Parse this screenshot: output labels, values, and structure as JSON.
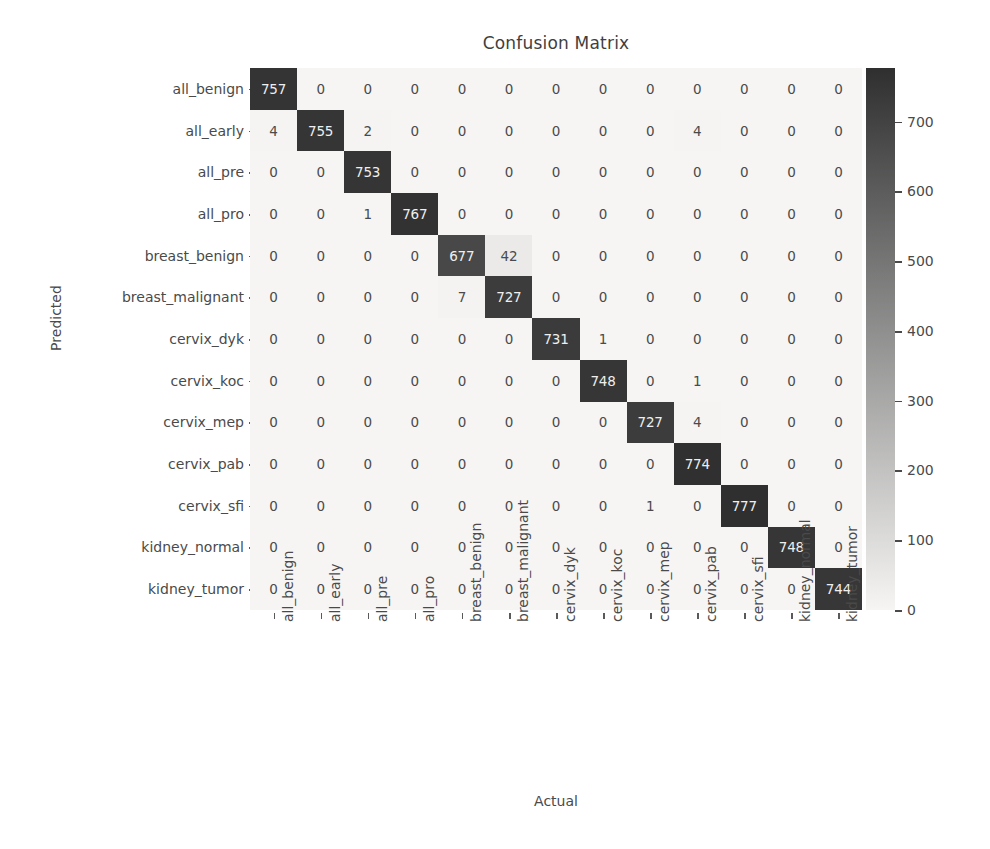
{
  "chart_data": {
    "type": "heatmap",
    "title": "Confusion Matrix",
    "xlabel": "Actual",
    "ylabel": "Predicted",
    "categories": [
      "all_benign",
      "all_early",
      "all_pre",
      "all_pro",
      "breast_benign",
      "breast_malignant",
      "cervix_dyk",
      "cervix_koc",
      "cervix_mep",
      "cervix_pab",
      "cervix_sfi",
      "kidney_normal",
      "kidney_tumor"
    ],
    "x_tick_labels": [
      "all_benign",
      "all_early",
      "all_pre",
      "all_pro",
      "breast_benign",
      "breast_malignant",
      "cervix_dyk",
      "cervix_koc",
      "cervix_mep",
      "cervix_pab",
      "cervix_sfi",
      "kidney_normal",
      "kidney_tumor"
    ],
    "y_tick_labels": [
      "all_benign",
      "all_early",
      "all_pre",
      "all_pro",
      "breast_benign",
      "breast_malignant",
      "cervix_dyk",
      "cervix_koc",
      "cervix_mep",
      "cervix_pab",
      "cervix_sfi",
      "kidney_normal",
      "kidney_tumor"
    ],
    "matrix": [
      [
        757,
        0,
        0,
        0,
        0,
        0,
        0,
        0,
        0,
        0,
        0,
        0,
        0
      ],
      [
        4,
        755,
        2,
        0,
        0,
        0,
        0,
        0,
        0,
        4,
        0,
        0,
        0
      ],
      [
        0,
        0,
        753,
        0,
        0,
        0,
        0,
        0,
        0,
        0,
        0,
        0,
        0
      ],
      [
        0,
        0,
        1,
        767,
        0,
        0,
        0,
        0,
        0,
        0,
        0,
        0,
        0
      ],
      [
        0,
        0,
        0,
        0,
        677,
        42,
        0,
        0,
        0,
        0,
        0,
        0,
        0
      ],
      [
        0,
        0,
        0,
        0,
        7,
        727,
        0,
        0,
        0,
        0,
        0,
        0,
        0
      ],
      [
        0,
        0,
        0,
        0,
        0,
        0,
        731,
        1,
        0,
        0,
        0,
        0,
        0
      ],
      [
        0,
        0,
        0,
        0,
        0,
        0,
        0,
        748,
        0,
        1,
        0,
        0,
        0
      ],
      [
        0,
        0,
        0,
        0,
        0,
        0,
        0,
        0,
        727,
        4,
        0,
        0,
        0
      ],
      [
        0,
        0,
        0,
        0,
        0,
        0,
        0,
        0,
        0,
        774,
        0,
        0,
        0
      ],
      [
        0,
        0,
        0,
        0,
        0,
        0,
        0,
        0,
        1,
        0,
        777,
        0,
        0
      ],
      [
        0,
        0,
        0,
        0,
        0,
        0,
        0,
        0,
        0,
        0,
        0,
        748,
        0
      ],
      [
        0,
        0,
        0,
        0,
        0,
        0,
        0,
        0,
        0,
        0,
        0,
        0,
        744
      ]
    ],
    "colorbar": {
      "ticks": [
        0,
        100,
        200,
        300,
        400,
        500,
        600,
        700
      ],
      "tick_labels": [
        "0",
        "100",
        "200",
        "300",
        "400",
        "500",
        "600",
        "700"
      ],
      "vmin": 0,
      "vmax": 777,
      "colormap": "grayscale-reversed",
      "low_color": "#f6f5f4",
      "high_color": "#2f2f2f",
      "position": "right"
    },
    "grid": false,
    "axes_background": "#f3f2f0",
    "annotation_light_color": "#efefef",
    "annotation_dark_color": "#4a4a4a"
  }
}
